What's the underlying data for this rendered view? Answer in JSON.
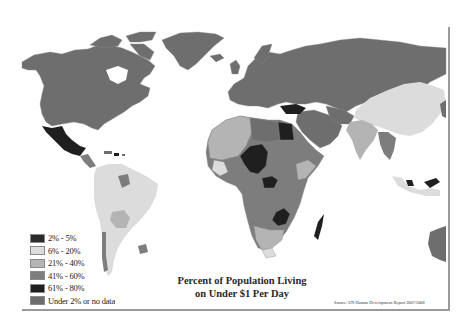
{
  "map": {
    "title_line1": "Percent of Population Living",
    "title_line2": "on Under $1 Per Day",
    "source": "Source: UN Human Development Report 2007/2008",
    "legend": [
      {
        "label": "2% - 5%",
        "color": "#2b2b2b"
      },
      {
        "label": "6% - 20%",
        "color": "#dcdcdc"
      },
      {
        "label": "21% - 40%",
        "color": "#b4b4b4"
      },
      {
        "label": "41% - 60%",
        "color": "#7d7d7d"
      },
      {
        "label": "61% - 80%",
        "color": "#1f1f1f"
      },
      {
        "label": "Under 2% or no data",
        "color": "#6e6e6e"
      }
    ],
    "colors": {
      "nodata": "#6e6e6e",
      "c6_20": "#dcdcdc",
      "c21_40": "#b4b4b4",
      "c41_60": "#7d7d7d",
      "c61_80": "#1f1f1f",
      "c2_5": "#2b2b2b",
      "frame": "#9a9a9a"
    },
    "regions": [
      {
        "name": "North America",
        "category": "Under 2% or no data"
      },
      {
        "name": "Greenland",
        "category": "Under 2% or no data"
      },
      {
        "name": "Mexico",
        "category": "2% - 5%"
      },
      {
        "name": "South America",
        "category": "6% - 20%"
      },
      {
        "name": "Bolivia",
        "category": "21% - 40%"
      },
      {
        "name": "Europe",
        "category": "Under 2% or no data"
      },
      {
        "name": "Russia",
        "category": "Under 2% or no data"
      },
      {
        "name": "Turkey",
        "category": "2% - 5%"
      },
      {
        "name": "Egypt",
        "category": "2% - 5%"
      },
      {
        "name": "China",
        "category": "6% - 20%"
      },
      {
        "name": "India",
        "category": "21% - 40%"
      },
      {
        "name": "Niger/Chad region",
        "category": "61% - 80%"
      },
      {
        "name": "Central African Republic",
        "category": "61% - 80%"
      },
      {
        "name": "Zambia",
        "category": "61% - 80%"
      },
      {
        "name": "Madagascar",
        "category": "61% - 80%"
      },
      {
        "name": "Australia",
        "category": "Under 2% or no data"
      }
    ]
  }
}
